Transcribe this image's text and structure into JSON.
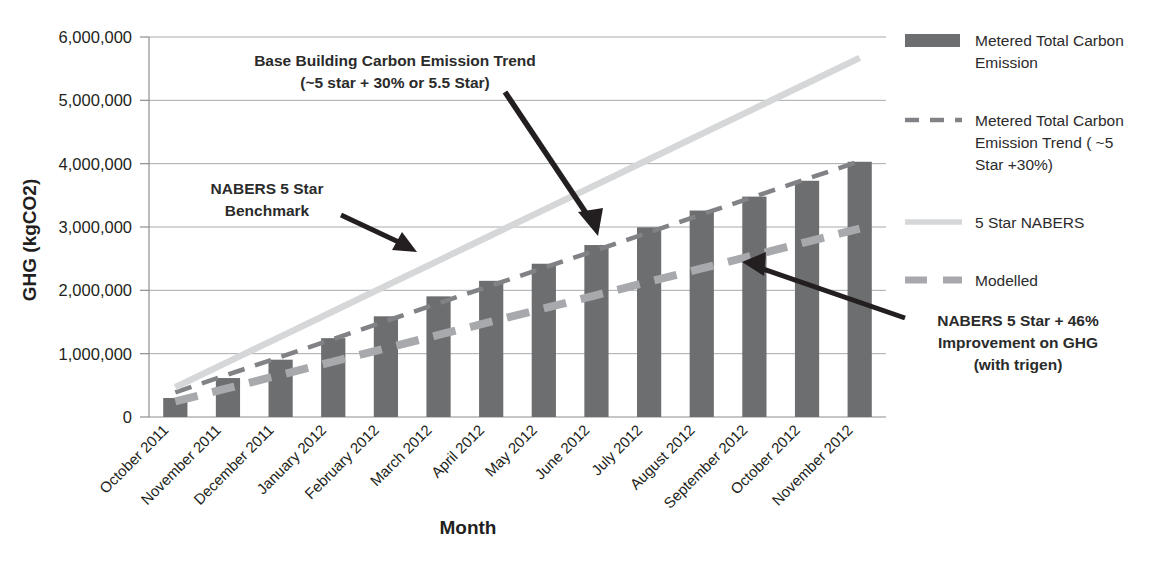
{
  "chart_data": {
    "type": "bar",
    "title": "",
    "xlabel": "Month",
    "ylabel": "GHG (kgCO2)",
    "ylim": [
      0,
      6000000
    ],
    "ytick_labels": [
      "6,000,000",
      "5,000,000",
      "4,000,000",
      "3,000,000",
      "2,000,000",
      "1,000,000",
      "0"
    ],
    "ytick_values": [
      6000000,
      5000000,
      4000000,
      3000000,
      2000000,
      1000000,
      0
    ],
    "grid": true,
    "legend_position": "right",
    "categories": [
      "October 2011",
      "November 2011",
      "December 2011",
      "January 2012",
      "February 2012",
      "March 2012",
      "April 2012",
      "May 2012",
      "June 2012",
      "July 2012",
      "August 2012",
      "September 2012",
      "October 2012",
      "November 2012"
    ],
    "series": [
      {
        "name": "Metered Total Carbon Emission",
        "type": "bar",
        "color": "#6d6e70",
        "values": [
          300000,
          615000,
          905000,
          1245000,
          1590000,
          1905000,
          2150000,
          2420000,
          2715000,
          2995000,
          3260000,
          3480000,
          3730000,
          4030000
        ]
      },
      {
        "name": "Metered Total Carbon Emission Trend ( ~5 Star +30%)",
        "type": "line",
        "style": "dashed-thin",
        "color": "#808285",
        "values": [
          390000,
          670000,
          950000,
          1230000,
          1515000,
          1795000,
          2075000,
          2355000,
          2635000,
          2915000,
          3200000,
          3480000,
          3760000,
          4040000
        ]
      },
      {
        "name": "5 Star NABERS",
        "type": "line",
        "style": "solid",
        "color": "#d6d7d8",
        "values": [
          470000,
          870000,
          1270000,
          1670000,
          2070000,
          2470000,
          2870000,
          3270000,
          3670000,
          4070000,
          4470000,
          4870000,
          5270000,
          5670000
        ]
      },
      {
        "name": "Modelled",
        "type": "line",
        "style": "dashed-thick",
        "color": "#a7a9ac",
        "values": [
          245000,
          455000,
          665000,
          875000,
          1085000,
          1295000,
          1505000,
          1715000,
          1925000,
          2135000,
          2345000,
          2555000,
          2765000,
          2975000
        ]
      }
    ],
    "annotations": [
      {
        "id": "base-building-trend",
        "lines": [
          "Base Building Carbon Emission Trend",
          "(~5 star + 30% or 5.5 Star)"
        ],
        "arrow": true
      },
      {
        "id": "nabers-benchmark",
        "lines": [
          "NABERS 5 Star",
          "Benchmark"
        ],
        "arrow": true
      },
      {
        "id": "nabers-improvement",
        "lines": [
          "NABERS 5 Star + 46%",
          "Improvement on GHG",
          "(with trigen)"
        ],
        "arrow": true
      }
    ]
  },
  "legend": {
    "items": [
      {
        "label_lines": [
          "Metered Total Carbon",
          "Emission"
        ],
        "marker": "bar-swatch"
      },
      {
        "label_lines": [
          "Metered Total Carbon",
          "Emission Trend ( ~5",
          "Star +30%)"
        ],
        "marker": "dashed-thin-line"
      },
      {
        "label_lines": [
          "5 Star NABERS"
        ],
        "marker": "solid-light-line"
      },
      {
        "label_lines": [
          "Modelled"
        ],
        "marker": "dashed-thick-line"
      }
    ]
  }
}
